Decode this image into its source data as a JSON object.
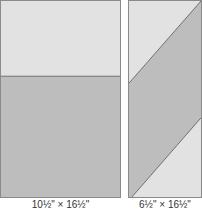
{
  "colors": {
    "light_fabric": "#e2e2e2",
    "dark_fabric": "#bdbdbd",
    "seam_line": "#6e6e6e",
    "border": "#8a8a8a",
    "background": "#ffffff",
    "caption_text": "#333333"
  },
  "panels": [
    {
      "id": "left",
      "description": "Rectangle split horizontally: light top section, dark bottom section",
      "caption": "10½\" × 16½\""
    },
    {
      "id": "right",
      "description": "Rectangle with diagonal dark band; light triangles at top-left and bottom-right",
      "caption": "6½\" × 16½\""
    }
  ]
}
